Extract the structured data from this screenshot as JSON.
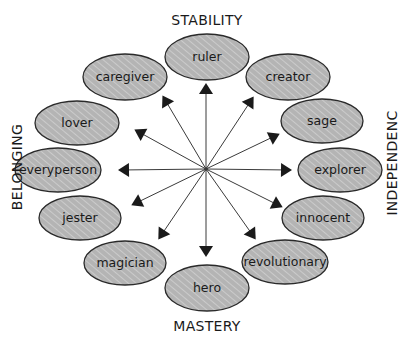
{
  "diagram": {
    "type": "radial-archetype-wheel",
    "center": {
      "x": 206,
      "y": 169
    },
    "colors": {
      "node_fill": "#b8b8b8",
      "node_stroke": "#2a2a2a",
      "arrow": "#1a1a1a",
      "line": "#3a3a3a",
      "background": "#ffffff"
    },
    "axis_labels": {
      "top": "STABILITY",
      "bottom": "MASTERY",
      "left": "BELONGING",
      "right": "INDEPENDENC"
    },
    "nodes": [
      {
        "id": "ruler",
        "label": "ruler",
        "cx": 207,
        "cy": 57,
        "rx": 42,
        "ry": 23,
        "arrow": {
          "x": 206,
          "y": 86
        }
      },
      {
        "id": "creator",
        "label": "creator",
        "cx": 288,
        "cy": 77,
        "rx": 42,
        "ry": 23,
        "arrow": {
          "x": 252,
          "y": 99
        }
      },
      {
        "id": "sage",
        "label": "sage",
        "cx": 322,
        "cy": 121,
        "rx": 41,
        "ry": 22,
        "arrow": {
          "x": 277,
          "y": 135
        }
      },
      {
        "id": "explorer",
        "label": "explorer",
        "cx": 340,
        "cy": 170,
        "rx": 42,
        "ry": 22,
        "arrow": {
          "x": 289,
          "y": 170
        }
      },
      {
        "id": "innocent",
        "label": "innocent",
        "cx": 323,
        "cy": 218,
        "rx": 41,
        "ry": 22,
        "arrow": {
          "x": 280,
          "y": 206
        }
      },
      {
        "id": "revolutionary",
        "label": "revolutionary",
        "cx": 285,
        "cy": 262,
        "rx": 43,
        "ry": 22,
        "arrow": {
          "x": 254,
          "y": 237
        }
      },
      {
        "id": "hero",
        "label": "hero",
        "cx": 207,
        "cy": 288,
        "rx": 42,
        "ry": 23,
        "arrow": {
          "x": 206,
          "y": 254
        }
      },
      {
        "id": "magician",
        "label": "magician",
        "cx": 125,
        "cy": 263,
        "rx": 41,
        "ry": 22,
        "arrow": {
          "x": 160,
          "y": 237
        }
      },
      {
        "id": "jester",
        "label": "jester",
        "cx": 80,
        "cy": 218,
        "rx": 41,
        "ry": 22,
        "arrow": {
          "x": 134,
          "y": 204
        }
      },
      {
        "id": "everyperson",
        "label": "everyperson",
        "cx": 58,
        "cy": 170,
        "rx": 43,
        "ry": 22,
        "arrow": {
          "x": 121,
          "y": 170
        }
      },
      {
        "id": "lover",
        "label": "lover",
        "cx": 77,
        "cy": 123,
        "rx": 42,
        "ry": 22,
        "arrow": {
          "x": 137,
          "y": 131
        }
      },
      {
        "id": "caregiver",
        "label": "caregiver",
        "cx": 125,
        "cy": 77,
        "rx": 42,
        "ry": 23,
        "arrow": {
          "x": 164,
          "y": 98
        }
      }
    ]
  }
}
